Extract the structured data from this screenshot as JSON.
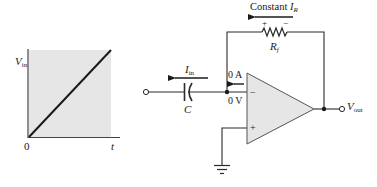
{
  "graph": {
    "y_label_main": "V",
    "y_label_sub": "in",
    "origin_label": "0",
    "x_label": "t",
    "plot_fill": "#e6e6e6",
    "line_color": "#1a1a1a",
    "chart_data": {
      "type": "line",
      "title": "",
      "xlabel": "t",
      "ylabel": "Vin",
      "series": [
        {
          "name": "Vin ramp",
          "x": [
            0,
            1
          ],
          "y": [
            0,
            1
          ]
        }
      ],
      "xlim": [
        0,
        1
      ],
      "ylim": [
        0,
        1
      ],
      "grid": false
    }
  },
  "circuit": {
    "feedback_label_prefix": "Constant ",
    "feedback_current_main": "I",
    "feedback_current_sub": "R",
    "resistor_plus": "+",
    "resistor_minus": "−",
    "resistor_label_main": "R",
    "resistor_label_sub": "f",
    "input_current_main": "I",
    "input_current_sub": "in",
    "capacitor_label": "C",
    "zero_current_label": "0 A",
    "virtual_ground_label": "0 V",
    "inverting_sign": "−",
    "noninverting_sign": "+",
    "output_label_main": "V",
    "output_label_sub": "out",
    "opamp_fill": "#e6e6e6",
    "wire_color": "#2a2a2a"
  }
}
